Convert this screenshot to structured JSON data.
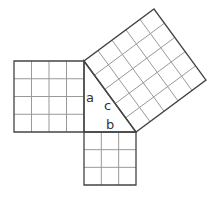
{
  "diagram": {
    "labels": {
      "a": "a",
      "b": "b",
      "c": "c"
    },
    "squares": [
      {
        "side": "a",
        "units": 4
      },
      {
        "side": "b",
        "units": 3
      },
      {
        "side": "c",
        "units": 5
      }
    ],
    "colors": {
      "outline": "#444444",
      "grid": "#999999",
      "background": "#ffffff"
    }
  }
}
